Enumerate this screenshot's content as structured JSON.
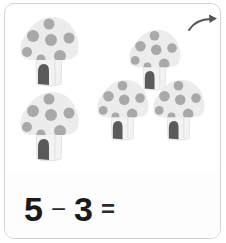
{
  "card": {
    "border_color": "#d4d4d4",
    "background": "#ffffff"
  },
  "next_arrow": {
    "icon": "curved-arrow-right-icon",
    "color": "#555555"
  },
  "mushrooms": {
    "count": 5,
    "cap_color": "#ececec",
    "spot_color": "#a9a9a9",
    "stem_color": "#f2f2f2",
    "door_color": "#5a5a5a",
    "items": [
      {
        "id": 1,
        "x": 18,
        "y": 14,
        "scale": 1.0
      },
      {
        "id": 2,
        "x": 127,
        "y": 27,
        "scale": 0.88
      },
      {
        "id": 3,
        "x": 18,
        "y": 89,
        "scale": 1.0
      },
      {
        "id": 4,
        "x": 95,
        "y": 77,
        "scale": 0.88
      },
      {
        "id": 5,
        "x": 151,
        "y": 77,
        "scale": 0.88
      }
    ]
  },
  "equation": {
    "operand_a": "5",
    "operator": "−",
    "operand_b": "3",
    "equals": "=",
    "answer": ""
  }
}
